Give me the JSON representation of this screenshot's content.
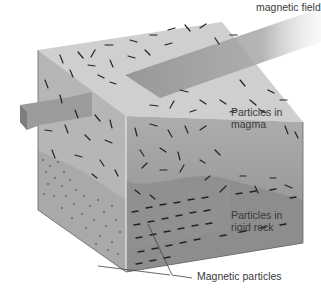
{
  "figure": {
    "labels": {
      "magnetic_field": "magnetic field",
      "particles_in_magma": [
        "Particles in",
        "magma"
      ],
      "particles_in_rigid_rock": [
        "Particles in",
        "rigid rock"
      ],
      "magnetic_particles": "Magnetic particles"
    },
    "colors": {
      "top_face": "#cfcfcf",
      "left_face": "#b4b4b4",
      "front_face_magma": "#a9a9a9",
      "front_face_rock": "#8c8c8c",
      "arrow": "#9a9a9a",
      "particles": "#222222",
      "text": "#3a3a3a"
    }
  }
}
